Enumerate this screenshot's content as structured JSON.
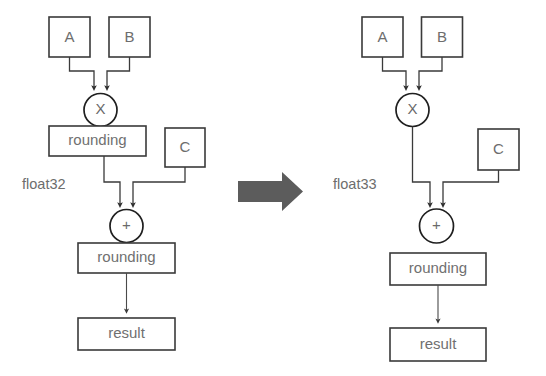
{
  "figure": {
    "type": "dataflow-diagram",
    "background_color": "#ffffff",
    "transform_arrow": {
      "icon": "right-arrow-icon",
      "color": "#5c5c5c"
    }
  },
  "left_diagram": {
    "title": "float32 rounded intermediate",
    "precision_label": "float32",
    "inputs": [
      {
        "id": "A",
        "label": "A"
      },
      {
        "id": "B",
        "label": "B"
      },
      {
        "id": "C",
        "label": "C"
      }
    ],
    "operations": [
      {
        "id": "mul",
        "label": "X",
        "shape": "circle"
      },
      {
        "id": "add",
        "label": "+",
        "shape": "circle"
      }
    ],
    "rounding_stages": [
      {
        "id": "round1",
        "label": "rounding"
      },
      {
        "id": "round2",
        "label": "rounding"
      }
    ],
    "output": {
      "id": "result",
      "label": "result"
    },
    "edges": [
      {
        "from": "A",
        "to": "mul"
      },
      {
        "from": "B",
        "to": "mul"
      },
      {
        "from": "mul",
        "to": "round1"
      },
      {
        "from": "round1",
        "to": "add"
      },
      {
        "from": "C",
        "to": "add"
      },
      {
        "from": "add",
        "to": "round2"
      },
      {
        "from": "round2",
        "to": "result"
      }
    ]
  },
  "right_diagram": {
    "title": "float33 unrounded intermediate",
    "precision_label": "float33",
    "inputs": [
      {
        "id": "A",
        "label": "A"
      },
      {
        "id": "B",
        "label": "B"
      },
      {
        "id": "C",
        "label": "C"
      }
    ],
    "operations": [
      {
        "id": "mul",
        "label": "X",
        "shape": "circle"
      },
      {
        "id": "add",
        "label": "+",
        "shape": "circle"
      }
    ],
    "rounding_stages": [
      {
        "id": "round1",
        "label": "rounding"
      }
    ],
    "output": {
      "id": "result",
      "label": "result"
    },
    "edges": [
      {
        "from": "A",
        "to": "mul"
      },
      {
        "from": "B",
        "to": "mul"
      },
      {
        "from": "mul",
        "to": "add"
      },
      {
        "from": "C",
        "to": "add"
      },
      {
        "from": "add",
        "to": "round1"
      },
      {
        "from": "round1",
        "to": "result"
      }
    ]
  }
}
